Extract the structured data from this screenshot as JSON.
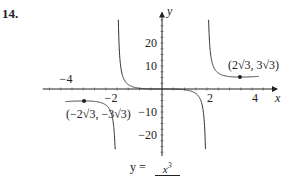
{
  "problem": {
    "number": "14."
  },
  "chart_data": {
    "type": "line",
    "title": "",
    "function": "y = x^3 / (x^2 - 4)",
    "caption": {
      "lhs": "y =",
      "numerator": "x",
      "numerator_exp": "3"
    },
    "xlabel": "x",
    "ylabel": "y",
    "xlim": [
      -5.3,
      5.2
    ],
    "ylim": [
      -30,
      35
    ],
    "x_ticks": [
      {
        "value": -4,
        "label": "−4"
      },
      {
        "value": -2,
        "label": "−2"
      },
      {
        "value": 2,
        "label": "2"
      },
      {
        "value": 4,
        "label": "4"
      }
    ],
    "y_ticks": [
      {
        "value": 20,
        "label": "20"
      },
      {
        "value": 10,
        "label": "10"
      },
      {
        "value": -10,
        "label": "−10"
      },
      {
        "value": -20,
        "label": "−20"
      }
    ],
    "vertical_asymptotes": [
      -2,
      2
    ],
    "series": [
      {
        "name": "left-branch",
        "x_range": [
          -4.3,
          -2.04
        ]
      },
      {
        "name": "middle-branch",
        "x_range": [
          -1.96,
          1.96
        ]
      },
      {
        "name": "right-branch",
        "x_range": [
          2.04,
          4.3
        ]
      }
    ],
    "points": [
      {
        "x": 3.4641,
        "y": 5.1962,
        "label": "(2√3, 3√3)"
      },
      {
        "x": -3.4641,
        "y": -5.1962,
        "label": "(−2√3, −3√3)"
      }
    ],
    "grid": false,
    "legend": "none"
  }
}
